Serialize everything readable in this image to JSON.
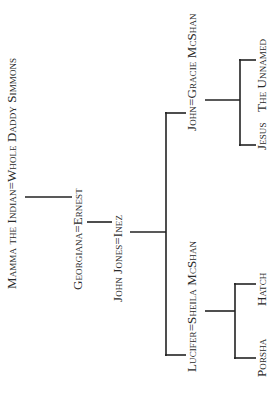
{
  "diagram": {
    "type": "family-tree",
    "orientation": "rotated-90-ccw",
    "couples": {
      "root": "Mamma the Indian=Whole Daddy Simmons",
      "gen2": "Georgiana=Ernest",
      "gen3": "John Jones=Inez",
      "gen4_a": "John=Gracie McShan",
      "gen4_b": "Lucifer=Sheila McShan"
    },
    "children": {
      "of_gen4_a": [
        "The Unnamed",
        "Jesus"
      ],
      "of_gen4_b": [
        "Hatch",
        "Porsha"
      ]
    },
    "line_color": "#222222",
    "text_color": "#2a2a2a"
  }
}
